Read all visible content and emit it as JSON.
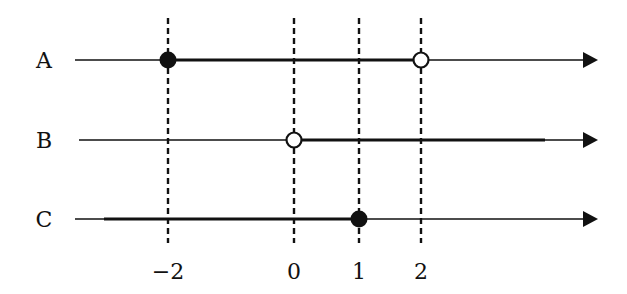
{
  "diagram": {
    "type": "number-line-intervals",
    "ticks": [
      {
        "value": -2,
        "label": "−2",
        "x": 168
      },
      {
        "value": 0,
        "label": "0",
        "x": 294
      },
      {
        "value": 1,
        "label": "1",
        "x": 359
      },
      {
        "value": 2,
        "label": "2",
        "x": 421
      }
    ],
    "rows": [
      {
        "label": "A",
        "y": 60,
        "interval": "[-2, 2)",
        "thick_from": 168,
        "thick_to": 421,
        "points": [
          {
            "value": -2,
            "x": 168,
            "style": "closed"
          },
          {
            "value": 2,
            "x": 421,
            "style": "open"
          }
        ]
      },
      {
        "label": "B",
        "y": 140,
        "interval": "(0, ∞)",
        "thick_from": 294,
        "thick_to": 545,
        "points": [
          {
            "value": 0,
            "x": 294,
            "style": "open"
          }
        ]
      },
      {
        "label": "C",
        "y": 219,
        "interval": "(-∞, 1]",
        "thick_from": 104,
        "thick_to": 359,
        "points": [
          {
            "value": 1,
            "x": 359,
            "style": "closed"
          }
        ]
      }
    ],
    "colors": {
      "ink": "#111111",
      "background": "#ffffff"
    }
  }
}
